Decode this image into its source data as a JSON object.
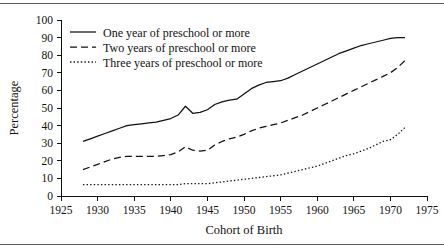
{
  "figure": {
    "has_top_rule": true,
    "has_bottom_rule": true,
    "background": "#ffffff",
    "ink_color": "#111111"
  },
  "chart_data": {
    "type": "line",
    "title": "",
    "subtitle": "",
    "xlabel": "Cohort of Birth",
    "ylabel": "Percentage",
    "xlim": [
      1925,
      1975
    ],
    "ylim": [
      0,
      100
    ],
    "xticks": [
      1925,
      1930,
      1935,
      1940,
      1945,
      1950,
      1955,
      1960,
      1965,
      1970,
      1975
    ],
    "yticks": [
      0,
      10,
      20,
      30,
      40,
      50,
      60,
      70,
      80,
      90,
      100
    ],
    "grid": false,
    "legend_position": "upper-left-inside",
    "x": [
      1928,
      1929,
      1930,
      1931,
      1932,
      1933,
      1934,
      1935,
      1936,
      1937,
      1938,
      1939,
      1940,
      1941,
      1942,
      1943,
      1944,
      1945,
      1946,
      1947,
      1948,
      1949,
      1950,
      1951,
      1952,
      1953,
      1954,
      1955,
      1956,
      1957,
      1958,
      1959,
      1960,
      1961,
      1962,
      1963,
      1964,
      1965,
      1966,
      1967,
      1968,
      1969,
      1970,
      1971,
      1972
    ],
    "series": [
      {
        "name": "One year of preschool or more",
        "style": "solid",
        "values": [
          31,
          32.5,
          34,
          35.5,
          37,
          38.5,
          40,
          40.5,
          41,
          41.5,
          42,
          43,
          44,
          46,
          51,
          47,
          47.5,
          49,
          52,
          53.5,
          54.5,
          55,
          58,
          61,
          63,
          64.5,
          65,
          65.5,
          67,
          69,
          71,
          73,
          75,
          77,
          79,
          81,
          82.5,
          84,
          85.5,
          86.5,
          87.5,
          88.5,
          89.5,
          90,
          90
        ]
      },
      {
        "name": "Two years of preschool or more",
        "style": "dashed",
        "values": [
          15,
          16.5,
          18,
          19.5,
          21,
          22,
          22.5,
          22.5,
          22.5,
          22.5,
          22.5,
          23,
          23.5,
          25,
          28,
          26,
          25.5,
          26,
          29,
          31,
          32.5,
          33.5,
          35,
          37,
          38.5,
          39.5,
          40.5,
          41.5,
          43,
          44.5,
          46,
          48,
          50,
          52,
          54,
          56,
          58,
          60,
          62,
          64,
          66,
          68,
          70,
          73,
          77
        ]
      },
      {
        "name": "Three years of preschool or more",
        "style": "dotted",
        "values": [
          6.5,
          6.5,
          6.5,
          6.5,
          6.5,
          6.5,
          6.5,
          6.5,
          6.5,
          6.5,
          6.5,
          6.5,
          6.5,
          6.5,
          7,
          7,
          7,
          7,
          7.5,
          8,
          8.5,
          9,
          9.5,
          10,
          10.5,
          11,
          11.5,
          12,
          13,
          14,
          15,
          16,
          17,
          18.5,
          20,
          21.5,
          23,
          24,
          25.5,
          27,
          29,
          31,
          32,
          35,
          39
        ]
      }
    ],
    "legend": [
      {
        "label": "One year of preschool or more",
        "style": "solid"
      },
      {
        "label": "Two years of preschool or more",
        "style": "dashed"
      },
      {
        "label": "Three years of preschool or more",
        "style": "dotted"
      }
    ]
  }
}
